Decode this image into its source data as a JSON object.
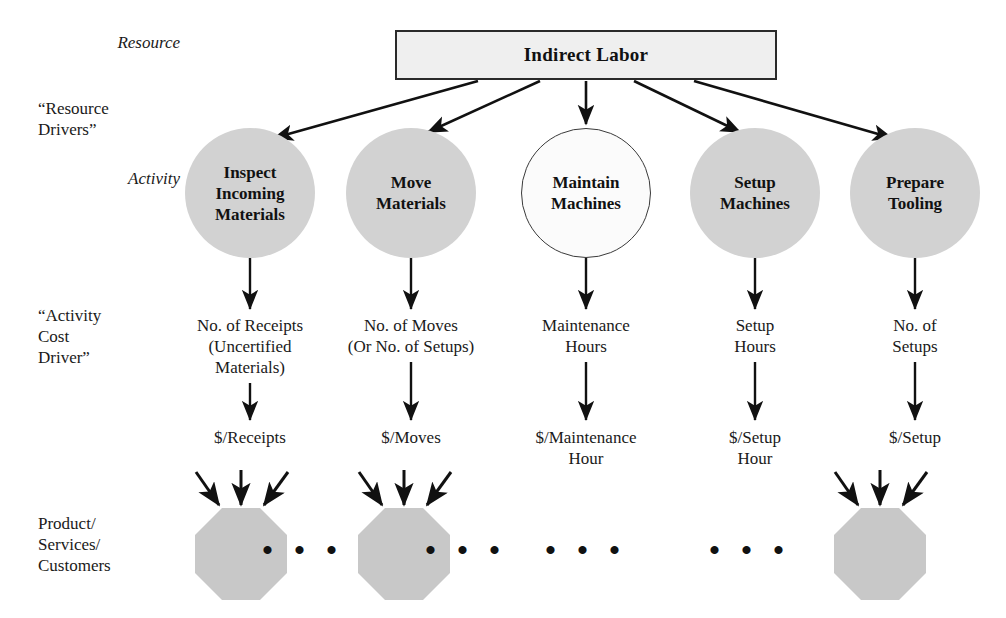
{
  "diagram": {
    "row_labels": [
      {
        "id": "resource",
        "text": "Resource",
        "style": "italic",
        "x": 108,
        "y": 40
      },
      {
        "id": "resource-drivers",
        "text": "“Resource\nDrivers”",
        "style": "plain",
        "x": 40,
        "y": 100
      },
      {
        "id": "activity",
        "text": "Activity",
        "style": "italic",
        "x": 108,
        "y": 170
      },
      {
        "id": "activity-cost-driver",
        "text": "“Activity\nCost\nDriver”",
        "style": "plain",
        "x": 40,
        "y": 307
      },
      {
        "id": "product-services-customers",
        "text": "Product/\nServices/\nCustomers",
        "style": "plain",
        "x": 40,
        "y": 515
      }
    ],
    "resource": {
      "label": "Indirect Labor"
    },
    "activities": [
      {
        "id": "inspect-incoming-materials",
        "label": "Inspect\nIncoming\nMaterials",
        "cx": 250,
        "filled": true,
        "cost_driver": "No. of Receipts\n(Uncertified\nMaterials)",
        "rate": "$/Receipts",
        "has_octagon": true,
        "ellipsis_after": true
      },
      {
        "id": "move-materials",
        "label": "Move\nMaterials",
        "cx": 411,
        "filled": true,
        "cost_driver": "No. of Moves\n(Or No. of Setups)",
        "rate": "$/Moves",
        "has_octagon": true,
        "ellipsis_after": true
      },
      {
        "id": "maintain-machines",
        "label": "Maintain\nMachines",
        "cx": 586,
        "filled": false,
        "cost_driver": "Maintenance\nHours",
        "rate": "$/Maintenance\nHour",
        "has_octagon": false,
        "ellipsis_after": false
      },
      {
        "id": "setup-machines",
        "label": "Setup\nMachines",
        "cx": 755,
        "filled": true,
        "cost_driver": "Setup\nHours",
        "rate": "$/Setup\nHour",
        "has_octagon": false,
        "ellipsis_after": false
      },
      {
        "id": "prepare-tooling",
        "label": "Prepare\nTooling",
        "cx": 915,
        "filled": true,
        "cost_driver": "No. of\nSetups",
        "rate": "$/Setup",
        "has_octagon": true,
        "ellipsis_after": false
      }
    ],
    "ellipses": [
      {
        "id": "ellipsis-1",
        "text": "• • •",
        "cx": 303,
        "cy": 550
      },
      {
        "id": "ellipsis-2",
        "text": "• • •",
        "cx": 466,
        "cy": 550
      },
      {
        "id": "ellipsis-3",
        "text": "• • •",
        "cx": 586,
        "cy": 550
      },
      {
        "id": "ellipsis-4",
        "text": "• • •",
        "cx": 750,
        "cy": 550
      }
    ],
    "octagons": [
      {
        "id": "octagon-products-1",
        "cx": 241,
        "cy": 550
      },
      {
        "id": "octagon-products-2",
        "cx": 404,
        "cy": 550
      },
      {
        "id": "octagon-products-3",
        "cx": 880,
        "cy": 550
      }
    ],
    "colors": {
      "fill_gray": "#d2d2d2",
      "box_fill": "#efefef",
      "stroke": "#1a1a1a",
      "background": "#ffffff"
    }
  }
}
